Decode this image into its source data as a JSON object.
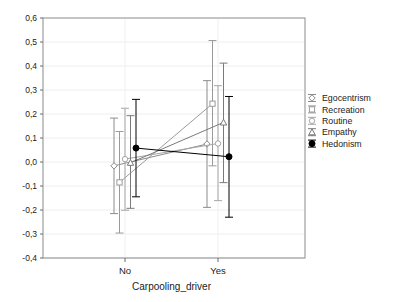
{
  "chart_data": {
    "type": "line",
    "title": "",
    "subtitle": "",
    "xlabel": "Carpooling_driver",
    "ylabel": "",
    "categories": [
      "No",
      "Yes"
    ],
    "ylim": [
      -0.4,
      0.6
    ],
    "ytick_labels": [
      "0,6",
      "0,5",
      "0,4",
      "0,3",
      "0,2",
      "0,1",
      "0,0",
      "-0,1",
      "-0,2",
      "-0,3",
      "-0,4"
    ],
    "ytick_values": [
      0.6,
      0.5,
      0.4,
      0.3,
      0.2,
      0.1,
      0.0,
      -0.1,
      -0.2,
      -0.3,
      -0.4
    ],
    "grid": true,
    "legend_position": "right",
    "error_bars": "95% CI",
    "series": [
      {
        "name": "Egocentrism",
        "color": "#8c8c8c",
        "marker": "diamond",
        "values": [
          -0.016,
          0.075
        ],
        "err_low": [
          -0.215,
          -0.189
        ],
        "err_high": [
          0.183,
          0.339
        ]
      },
      {
        "name": "Recreation",
        "color": "#9a9a9a",
        "marker": "square",
        "values": [
          -0.085,
          0.243
        ],
        "err_low": [
          -0.296,
          -0.016
        ],
        "err_high": [
          0.127,
          0.506
        ]
      },
      {
        "name": "Routine",
        "color": "#a6a6a6",
        "marker": "circle",
        "values": [
          0.012,
          0.077
        ],
        "err_low": [
          -0.201,
          -0.161
        ],
        "err_high": [
          0.224,
          0.318
        ]
      },
      {
        "name": "Empathy",
        "color": "#7a7a7a",
        "marker": "triangle",
        "values": [
          -0.003,
          0.165
        ],
        "err_low": [
          -0.193,
          -0.086
        ],
        "err_high": [
          0.193,
          0.412
        ]
      },
      {
        "name": "Hedonism",
        "color": "#000000",
        "marker": "filled-circle",
        "values": [
          0.058,
          0.022
        ],
        "err_low": [
          -0.145,
          -0.23
        ],
        "err_high": [
          0.261,
          0.273
        ]
      }
    ]
  }
}
